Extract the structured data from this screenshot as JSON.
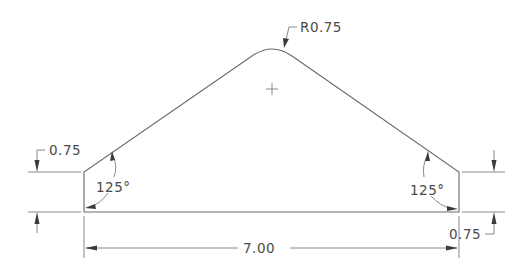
{
  "drawing": {
    "type": "technical-drawing",
    "units_hint": "inches",
    "colors": {
      "line": "#6a6a6a",
      "text": "#4a4a4a",
      "background": "#ffffff"
    },
    "dimensions": {
      "overall_width": "7.00",
      "left_height": "0.75",
      "right_height": "0.75",
      "apex_radius": "R0.75",
      "left_angle": "125°",
      "right_angle": "125°"
    },
    "marks": {
      "center_mark": "+"
    }
  }
}
